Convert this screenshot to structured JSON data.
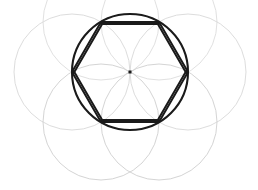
{
  "figure": {
    "background_color": "#ffffff",
    "width": 258,
    "height": 190
  },
  "geometry": {
    "center": {
      "x": 130,
      "y": 72,
      "label": "center-point"
    },
    "main_circle": {
      "label": "circumscribed-circle",
      "cx": 130,
      "cy": 72,
      "r": 58,
      "color": "#1a1a1a",
      "stroke_width": 2.1
    },
    "center_dot": {
      "label": "center-marker",
      "x": 130,
      "y": 72,
      "size": 3,
      "color": "#1a1a1a"
    },
    "hexagon": {
      "label": "inscribed-hexagon",
      "sides": 6,
      "orientation": "flat-top",
      "color": "#1a1a1a",
      "stroke_width": 2.0,
      "double_stroke": true,
      "double_offset": 2.0,
      "vertices": [
        {
          "name": "vertex-left",
          "x": 72,
          "y": 72
        },
        {
          "name": "vertex-top-left",
          "x": 101,
          "y": 22
        },
        {
          "name": "vertex-top-right",
          "x": 159,
          "y": 22
        },
        {
          "name": "vertex-right",
          "x": 188,
          "y": 72
        },
        {
          "name": "vertex-bottom-right",
          "x": 159,
          "y": 122
        },
        {
          "name": "vertex-bottom-left",
          "x": 101,
          "y": 122
        }
      ]
    },
    "construction_circles": {
      "label": "compass-construction-arcs",
      "r": 58,
      "count": 6,
      "circles": [
        {
          "name": "arc-left",
          "cx": 72,
          "cy": 72,
          "color": "#d8d8d8",
          "stroke_width": 0.9
        },
        {
          "name": "arc-top-left",
          "cx": 101,
          "cy": 22,
          "color": "#dcdcdc",
          "stroke_width": 0.9
        },
        {
          "name": "arc-top-right",
          "cx": 159,
          "cy": 22,
          "color": "#dcdcdc",
          "stroke_width": 0.9
        },
        {
          "name": "arc-right",
          "cx": 188,
          "cy": 72,
          "color": "#d8d8d8",
          "stroke_width": 0.9
        },
        {
          "name": "arc-bottom-right",
          "cx": 159,
          "cy": 122,
          "color": "#cfcfcf",
          "stroke_width": 0.9
        },
        {
          "name": "arc-bottom-left",
          "cx": 101,
          "cy": 122,
          "color": "#cfcfcf",
          "stroke_width": 0.9
        }
      ]
    }
  },
  "chart_data": {
    "type": "scatter",
    "subtitle": "",
    "xlabel": "",
    "ylabel": "",
    "xlim": [
      0,
      258
    ],
    "ylim": [
      0,
      190
    ],
    "grid": false,
    "legend": "none",
    "annotations": [
      "center point marked with small filled square",
      "hexagon edges drawn with a doubled construction stroke",
      "six faint construction circles of equal radius centered on each hexagon vertex"
    ],
    "series": [
      {
        "name": "hexagon-vertices",
        "type": "scatter",
        "x": [
          72,
          101,
          159,
          188,
          159,
          101
        ],
        "y": [
          72,
          22,
          22,
          72,
          122,
          122
        ]
      },
      {
        "name": "circle-center",
        "type": "scatter",
        "x": [
          130
        ],
        "y": [
          72
        ]
      },
      {
        "name": "construction-circle-centers",
        "type": "scatter",
        "x": [
          72,
          101,
          159,
          188,
          159,
          101
        ],
        "y": [
          72,
          22,
          22,
          72,
          122,
          122
        ]
      }
    ],
    "radii": {
      "main_circle": 58,
      "construction_circles": 58,
      "hexagon_side": 58
    }
  }
}
